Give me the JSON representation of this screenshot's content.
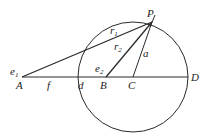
{
  "diagram": {
    "type": "geometry",
    "colors": {
      "stroke": "#2a2a2a",
      "text": "#222222",
      "background": "#ffffff"
    },
    "circle": {
      "cx": 133,
      "cy": 77,
      "r": 55
    },
    "points": {
      "A": {
        "x": 22,
        "y": 77,
        "label": "A"
      },
      "B": {
        "x": 106,
        "y": 77,
        "label": "B"
      },
      "C": {
        "x": 133,
        "y": 77,
        "label": "C"
      },
      "D": {
        "x": 188,
        "y": 77,
        "label": "D"
      },
      "P": {
        "x": 152,
        "y": 22,
        "label": "P"
      }
    },
    "segment_labels": {
      "r1": {
        "base": "r",
        "sub": "1"
      },
      "r2": {
        "base": "r",
        "sub": "2"
      },
      "a": "a",
      "f": "f",
      "d": "d"
    },
    "angle_labels": {
      "e1": {
        "base": "e",
        "sub": "1"
      },
      "e2": {
        "base": "e",
        "sub": "2"
      }
    }
  }
}
